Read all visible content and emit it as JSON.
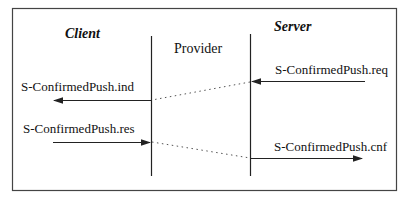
{
  "diagram": {
    "type": "sequence",
    "colors": {
      "line": "#222222",
      "frame": "#444444",
      "dotted": "#555555",
      "background": "#ffffff"
    },
    "participants": [
      {
        "id": "client",
        "label": "Client"
      },
      {
        "id": "provider",
        "label": "Provider"
      },
      {
        "id": "server",
        "label": "Server"
      }
    ],
    "messages": [
      {
        "id": "req",
        "label": "S-ConfirmedPush.req",
        "direction": "left",
        "side": "server"
      },
      {
        "id": "ind",
        "label": "S-ConfirmedPush.ind",
        "direction": "left",
        "side": "client"
      },
      {
        "id": "res",
        "label": "S-ConfirmedPush.res",
        "direction": "right",
        "side": "client"
      },
      {
        "id": "cnf",
        "label": "S-ConfirmedPush.cnf",
        "direction": "right",
        "side": "server"
      }
    ]
  }
}
